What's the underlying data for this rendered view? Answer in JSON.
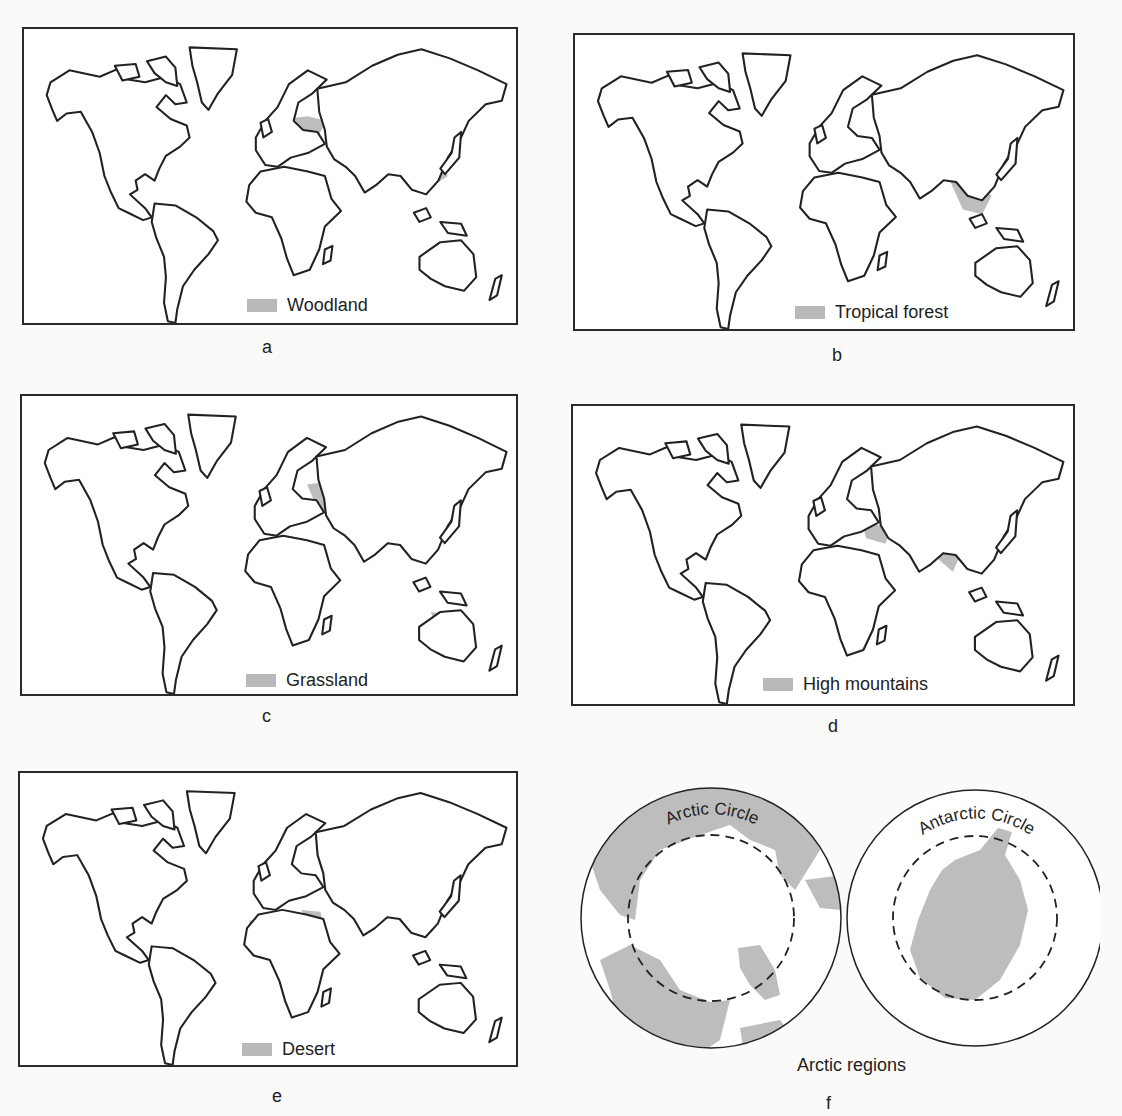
{
  "figure": {
    "panels": [
      {
        "id": "a",
        "legend": "Woodland",
        "caption": "a"
      },
      {
        "id": "b",
        "legend": "Tropical forest",
        "caption": "b"
      },
      {
        "id": "c",
        "legend": "Grassland",
        "caption": "c"
      },
      {
        "id": "d",
        "legend": "High mountains",
        "caption": "d"
      },
      {
        "id": "e",
        "legend": "Desert",
        "caption": "e"
      },
      {
        "id": "f",
        "caption": "f",
        "title": "Arctic regions",
        "circles": [
          {
            "label": "Arctic Circle"
          },
          {
            "label": "Antarctic Circle"
          }
        ]
      }
    ],
    "colors": {
      "shade": "#bdbdbd",
      "outline": "#222222",
      "background": "#ffffff"
    }
  }
}
